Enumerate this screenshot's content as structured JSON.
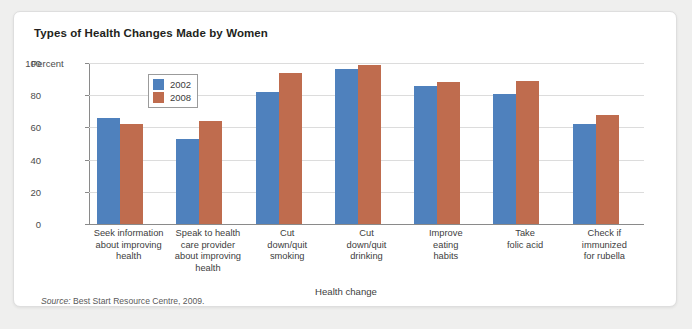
{
  "figure": {
    "title": "Types of Health Changes Made by Women",
    "source_label": "Source:",
    "source_text": "Best Start Resource Centre, 2009."
  },
  "chart_data": {
    "type": "bar",
    "title": "Types of Health Changes Made by Women",
    "xlabel": "Health change",
    "ylabel": "Percent",
    "ylim": [
      0,
      100
    ],
    "yticks": [
      0,
      20,
      40,
      60,
      80,
      100
    ],
    "grid": true,
    "legend_position": "upper-left-inside",
    "categories": [
      "Seek information about improving health",
      "Speak to health care provider about improving health",
      "Cut down/quit smoking",
      "Cut down/quit drinking",
      "Improve eating habits",
      "Take folic acid",
      "Check if immunized for rubella"
    ],
    "category_lines": [
      [
        "Seek information",
        "about improving",
        "health"
      ],
      [
        "Speak to health",
        "care provider",
        "about improving",
        "health"
      ],
      [
        "Cut",
        "down/quit",
        "smoking"
      ],
      [
        "Cut",
        "down/quit",
        "drinking"
      ],
      [
        "Improve",
        "eating",
        "habits"
      ],
      [
        "Take",
        "folic acid"
      ],
      [
        "Check if",
        "immunized",
        "for rubella"
      ]
    ],
    "series": [
      {
        "name": "2002",
        "color": "#4f81bd",
        "values": [
          66,
          53,
          82,
          96,
          86,
          81,
          62
        ]
      },
      {
        "name": "2008",
        "color": "#bf6c4e",
        "values": [
          62,
          64,
          94,
          99,
          88,
          89,
          68
        ]
      }
    ]
  }
}
